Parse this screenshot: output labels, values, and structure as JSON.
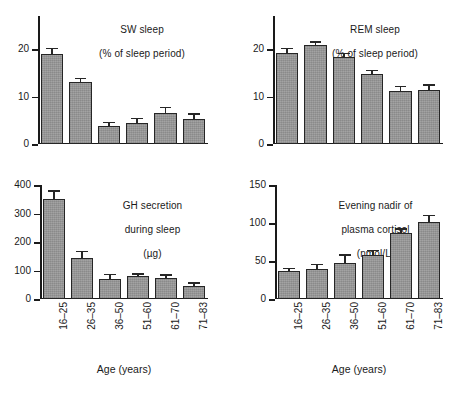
{
  "figure": {
    "shared_xlabel": "Age (years)",
    "categories": [
      "16–25",
      "26–35",
      "36–50",
      "51–60",
      "61–70",
      "71–83"
    ]
  },
  "chart_data": [
    {
      "type": "bar",
      "panel_id": "sw-sleep",
      "title": "SW sleep\n(% of sleep period)",
      "title_line1": "SW sleep",
      "title_line2": "(% of sleep period)",
      "xlabel": "",
      "ylabel": "",
      "categories": [
        "16–25",
        "26–35",
        "36–50",
        "51–60",
        "61–70",
        "71–83"
      ],
      "values": [
        19.0,
        13.1,
        3.8,
        4.5,
        6.6,
        5.2
      ],
      "errors": [
        1.3,
        0.9,
        0.9,
        1.0,
        1.2,
        1.3
      ],
      "yticks": [
        0,
        10,
        20
      ],
      "ytick_labels": [
        "0",
        "10",
        "20"
      ],
      "ylim": [
        0,
        24
      ],
      "grid": false,
      "legend": false,
      "bar_color": "#9a9a9a",
      "edge_color": "#262626"
    },
    {
      "type": "bar",
      "panel_id": "rem-sleep",
      "title": "REM sleep\n(% of sleep period)",
      "title_line1": "REM sleep",
      "title_line2": "(% of sleep period)",
      "xlabel": "",
      "ylabel": "",
      "categories": [
        "16–25",
        "26–35",
        "36–50",
        "51–60",
        "61–70",
        "71–83"
      ],
      "values": [
        19.1,
        20.8,
        18.4,
        14.8,
        11.2,
        11.4
      ],
      "errors": [
        1.1,
        0.8,
        0.8,
        0.8,
        1.1,
        1.2
      ],
      "yticks": [
        0,
        10,
        20
      ],
      "ytick_labels": [
        "0",
        "10",
        "20"
      ],
      "ylim": [
        0,
        24
      ],
      "grid": false,
      "legend": false,
      "bar_color": "#9a9a9a",
      "edge_color": "#262626"
    },
    {
      "type": "bar",
      "panel_id": "gh-secretion",
      "title": "GH secretion\nduring sleep\n(µg)",
      "title_line1": "GH secretion",
      "title_line2": "during sleep",
      "title_line3": "(µg)",
      "xlabel": "Age (years)",
      "ylabel": "",
      "categories": [
        "16–25",
        "26–35",
        "36–50",
        "51–60",
        "61–70",
        "71–83"
      ],
      "values": [
        350,
        145,
        70,
        80,
        72,
        45
      ],
      "errors": [
        32,
        25,
        18,
        10,
        14,
        14
      ],
      "yticks": [
        0,
        100,
        200,
        300,
        400
      ],
      "ytick_labels": [
        "0",
        "100",
        "200",
        "300",
        "400"
      ],
      "ylim": [
        0,
        400
      ],
      "grid": false,
      "legend": false,
      "bar_color": "#9a9a9a",
      "edge_color": "#262626"
    },
    {
      "type": "bar",
      "panel_id": "evening-cortisol",
      "title": "Evening nadir of\nplasma cortisol\n(nmol/L)",
      "title_line1": "Evening nadir of",
      "title_line2": "plasma cortisol",
      "title_line3": "(nmol/L)",
      "xlabel": "Age (years)",
      "ylabel": "",
      "categories": [
        "16–25",
        "26–35",
        "36–50",
        "51–60",
        "61–70",
        "71–83"
      ],
      "values": [
        37,
        40,
        48,
        58,
        87,
        101
      ],
      "errors": [
        4,
        6,
        11,
        7,
        6,
        10
      ],
      "yticks": [
        0,
        50,
        100,
        150
      ],
      "ytick_labels": [
        "0",
        "50",
        "100",
        "150"
      ],
      "ylim": [
        0,
        150
      ],
      "grid": false,
      "legend": false,
      "bar_color": "#9a9a9a",
      "edge_color": "#262626"
    }
  ]
}
